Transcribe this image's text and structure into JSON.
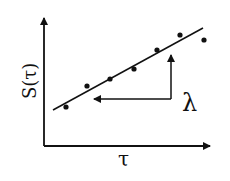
{
  "diagram": {
    "type": "scatter-with-fit",
    "xlabel": "τ",
    "ylabel": "S(τ)",
    "annotation": "λ",
    "colors": {
      "ink": "#111111",
      "background": "#ffffff"
    },
    "axes": {
      "origin": [
        44,
        146
      ],
      "y_top": [
        44,
        15
      ],
      "x_right": [
        213,
        146
      ]
    },
    "fit_line": {
      "from": [
        53,
        110
      ],
      "to": [
        203,
        28
      ]
    },
    "points": [
      [
        66,
        107
      ],
      [
        87,
        86
      ],
      [
        110,
        79
      ],
      [
        134,
        69
      ],
      [
        157,
        50
      ],
      [
        180,
        35
      ],
      [
        204,
        40
      ]
    ],
    "arrows": {
      "vertical": {
        "from": [
          171,
          99
        ],
        "to": [
          171,
          53
        ]
      },
      "horizontal": {
        "from": [
          171,
          99
        ],
        "to": [
          92,
          99
        ]
      }
    }
  }
}
